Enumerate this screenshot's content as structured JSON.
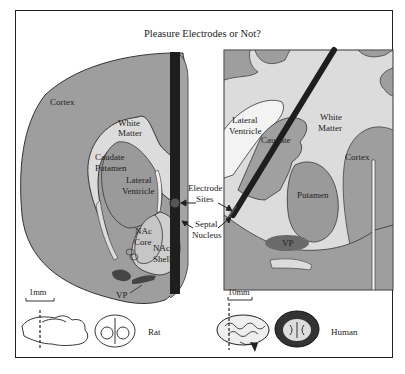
{
  "title": "Pleasure Electrodes or Not?",
  "colors": {
    "tissue_gray": "#9e9e9e",
    "white_matter": "#dedede",
    "dark_region": "#5a5a5a",
    "electrode": "#1e1e1e",
    "outline": "#333333",
    "background": "#ffffff"
  },
  "rat_panel": {
    "labels": {
      "cortex": "Cortex",
      "white_matter": "White\nMatter",
      "white_line1": "White",
      "white_line2": "Matter",
      "caudate_line1": "Caudate",
      "caudate_line2": "Putamen",
      "lateral_line1": "Lateral",
      "lateral_line2": "Ventricle",
      "nac_core_line1": "NAc",
      "nac_core_line2": "Core",
      "nac_shell_line1": "NAc",
      "nac_shell_line2": "Shell",
      "vp": "VP"
    },
    "scale_bar": "1mm",
    "species": "Rat"
  },
  "center_labels": {
    "electrode_line1": "Electrode",
    "electrode_line2": "Sites",
    "septal_line1": "Septal",
    "septal_line2": "Nucleus"
  },
  "human_panel": {
    "labels": {
      "lateral_line1": "Lateral",
      "lateral_line2": "Ventricle",
      "white_line1": "White",
      "white_line2": "Matter",
      "caudate": "Caudate",
      "cortex": "Cortex",
      "putamen": "Putamen",
      "vp": "VP"
    },
    "scale_bar": "10mm",
    "species": "Human"
  }
}
